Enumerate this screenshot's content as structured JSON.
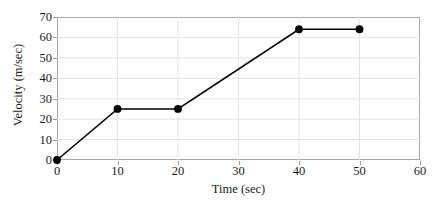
{
  "chart_data": {
    "type": "line",
    "title": "",
    "xlabel": "Time (sec)",
    "ylabel": "Velocity (m/sec)",
    "x": [
      0,
      10,
      20,
      40,
      50
    ],
    "values": [
      0,
      25,
      25,
      64,
      64
    ],
    "series": [
      {
        "name": "Velocity",
        "x": [
          0,
          10,
          20,
          40,
          50
        ],
        "values": [
          0,
          25,
          25,
          64,
          64
        ],
        "line_color": "#000000",
        "marker_color": "#000000",
        "marker": "circle"
      }
    ],
    "xlim": [
      0,
      60
    ],
    "ylim": [
      0,
      70
    ],
    "xticks": [
      0,
      10,
      20,
      30,
      40,
      50,
      60
    ],
    "yticks": [
      0,
      10,
      20,
      30,
      40,
      50,
      60,
      70
    ],
    "xtick_labels": [
      "0",
      "10",
      "20",
      "30",
      "40",
      "50",
      "60"
    ],
    "ytick_labels": [
      "0",
      "10",
      "20",
      "30",
      "40",
      "50",
      "60",
      "70"
    ],
    "grid": true,
    "grid_color": "#e4e4e4",
    "frame_color": "#a8a8a8",
    "background": "#ffffff",
    "legend": null,
    "legend_position": "none",
    "annotations": []
  }
}
